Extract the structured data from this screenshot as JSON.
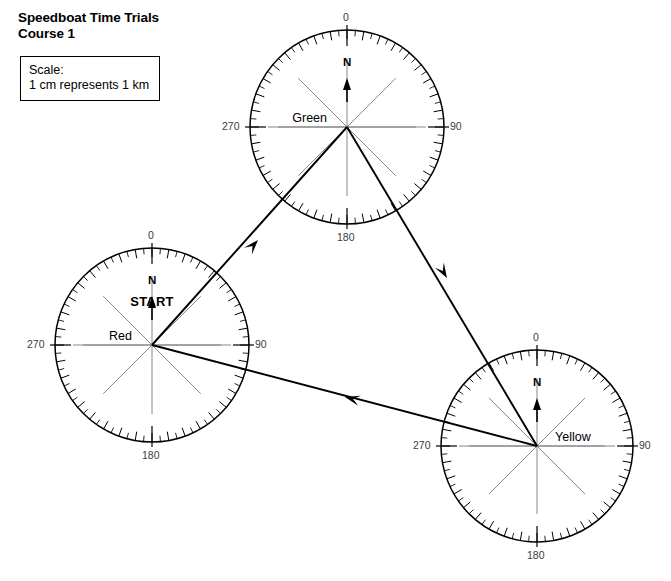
{
  "title": {
    "line1": "Speedboat Time Trials",
    "line2": "Course 1"
  },
  "scale_box": {
    "label": "Scale:",
    "value": "1 cm represents 1 km"
  },
  "chart_data": {
    "type": "diagram",
    "title": "Speedboat Time Trials Course 1",
    "subtitle": "Course 1",
    "scale": "1 cm represents 1 km",
    "grid": false,
    "legend_position": "none",
    "xlabel": "",
    "ylabel": "",
    "compass_ticks": {
      "major_labels": [
        "0",
        "90",
        "180",
        "270"
      ],
      "minor_interval_degrees": 5,
      "major_interval_degrees": 10,
      "full_circle_degrees": 360
    },
    "stations": [
      {
        "name": "Red",
        "label": "Red",
        "label_side": "left",
        "is_start": true,
        "start_label": "START",
        "north_label": "N",
        "center": {
          "x": 152,
          "y": 345
        },
        "radius": 97,
        "tick_labels": {
          "n": "0",
          "e": "90",
          "s": "180",
          "w": "270"
        }
      },
      {
        "name": "Green",
        "label": "Green",
        "label_side": "left",
        "is_start": false,
        "start_label": "",
        "north_label": "N",
        "center": {
          "x": 347,
          "y": 127
        },
        "radius": 97,
        "tick_labels": {
          "n": "0",
          "e": "90",
          "s": "180",
          "w": "270"
        }
      },
      {
        "name": "Yellow",
        "label": "Yellow",
        "label_side": "right",
        "is_start": false,
        "start_label": "",
        "north_label": "N",
        "center": {
          "x": 537,
          "y": 446
        },
        "radius": 96,
        "tick_labels": {
          "n": "0",
          "e": "90",
          "s": "180",
          "w": "270"
        }
      }
    ],
    "legs": [
      {
        "from": "Red",
        "to": "Green",
        "arrow_at": {
          "x": 258,
          "y": 240
        }
      },
      {
        "from": "Green",
        "to": "Yellow",
        "arrow_at": {
          "x": 447,
          "y": 278
        }
      },
      {
        "from": "Yellow",
        "to": "Red",
        "arrow_at": {
          "x": 345,
          "y": 397
        }
      }
    ]
  }
}
